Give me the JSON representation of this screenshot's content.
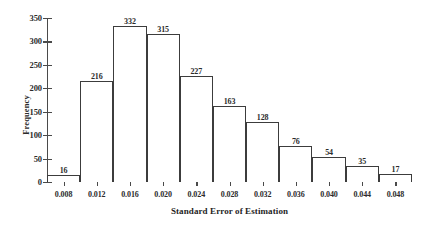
{
  "chart_data": {
    "type": "bar",
    "title": "",
    "subtitle": "",
    "xlabel": "Standard Error of Estimation",
    "ylabel": "Frequency",
    "categories": [
      "0.006",
      "0.010",
      "0.014",
      "0.018",
      "0.022",
      "0.026",
      "0.030",
      "0.034",
      "0.038",
      "0.042",
      "0.046"
    ],
    "bin_edges": [
      0.006,
      0.01,
      0.014,
      0.018,
      0.022,
      0.026,
      0.03,
      0.034,
      0.038,
      0.042,
      0.046,
      0.05
    ],
    "values": [
      16,
      216,
      332,
      315,
      227,
      163,
      128,
      76,
      54,
      35,
      17
    ],
    "data_labels": [
      "16",
      "216",
      "332",
      "315",
      "227",
      "163",
      "128",
      "76",
      "54",
      "35",
      "17"
    ],
    "ylim": [
      0,
      350
    ],
    "xlim": [
      0.006,
      0.05
    ],
    "y_ticks": [
      0,
      50,
      100,
      150,
      200,
      250,
      300,
      350
    ],
    "y_tick_labels": [
      "0",
      "50",
      "100",
      "150",
      "200",
      "250",
      "300",
      "350"
    ],
    "x_ticks": [
      0.008,
      0.012,
      0.016,
      0.02,
      0.024,
      0.028,
      0.032,
      0.036,
      0.04,
      0.044,
      0.048
    ],
    "x_tick_labels": [
      "0.008",
      "0.012",
      "0.016",
      "0.020",
      "0.024",
      "0.028",
      "0.032",
      "0.036",
      "0.040",
      "0.044",
      "0.048"
    ],
    "grid": false,
    "legend": null,
    "bar_fill": "#ffffff",
    "bar_edge": "#3c3c3c",
    "axis_color": "#4a4a4a",
    "text_color": "#2b2b2b"
  }
}
